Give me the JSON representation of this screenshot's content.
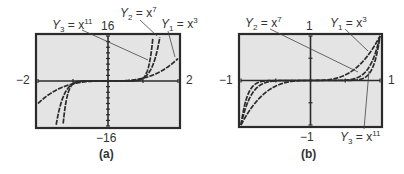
{
  "chart_data": [
    {
      "type": "line",
      "caption": "(a)",
      "xlim": [
        -2,
        2
      ],
      "ylim": [
        -16,
        16
      ],
      "x_tick_labels": {
        "left": "−2",
        "right": "2"
      },
      "y_tick_labels": {
        "top": "16",
        "bottom": "−16"
      },
      "x_ticks_every": 1,
      "y_ticks_every": 2,
      "grid": false,
      "series": [
        {
          "name": "Y1 = x3",
          "label_main": "Y",
          "label_sub": "1",
          "label_eq": " = x",
          "label_exp": "3",
          "exponent": 3
        },
        {
          "name": "Y2 = x7",
          "label_main": "Y",
          "label_sub": "2",
          "label_eq": " = x",
          "label_exp": "7",
          "exponent": 7
        },
        {
          "name": "Y3 = x11",
          "label_main": "Y",
          "label_sub": "3",
          "label_eq": " = x",
          "label_exp": "11",
          "exponent": 11
        }
      ]
    },
    {
      "type": "line",
      "caption": "(b)",
      "xlim": [
        -1,
        1
      ],
      "ylim": [
        -1,
        1
      ],
      "x_tick_labels": {
        "left": "−1",
        "right": "1"
      },
      "y_tick_labels": {
        "top": "1",
        "bottom": "−1"
      },
      "x_ticks_every": 0.5,
      "y_ticks_every": 0.5,
      "grid": false,
      "series": [
        {
          "name": "Y1 = x3",
          "label_main": "Y",
          "label_sub": "1",
          "label_eq": " = x",
          "label_exp": "3",
          "exponent": 3
        },
        {
          "name": "Y2 = x7",
          "label_main": "Y",
          "label_sub": "2",
          "label_eq": " = x",
          "label_exp": "7",
          "exponent": 7
        },
        {
          "name": "Y3 = x11",
          "label_main": "Y",
          "label_sub": "3",
          "label_eq": " = x",
          "label_exp": "11",
          "exponent": 11
        }
      ]
    }
  ],
  "colors": {
    "screen_bg": "#e4e4e4",
    "frame": "#2b2b2b",
    "curve": "#2b2b2b",
    "text": "#333333"
  }
}
